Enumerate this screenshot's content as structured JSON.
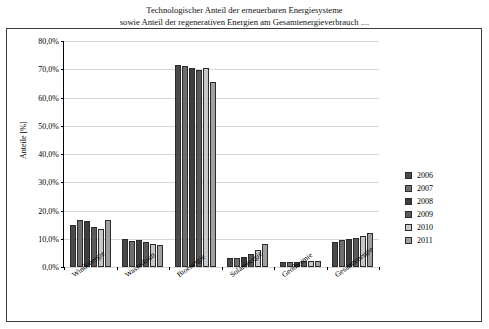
{
  "title": {
    "line1": "Technologischer Anteil der erneuerbaren Energiesysteme",
    "line2": "sowie Anteil der  regenerativen Energien am Gesamtenergieverbrauch ...."
  },
  "chart_data": {
    "type": "bar",
    "title": "Technologischer Anteil der erneuerbaren Energiesysteme sowie Anteil der  regenerativen Energien am Gesamtenergieverbrauch ....",
    "xlabel": "",
    "ylabel": "Anteile [%]",
    "ylim": [
      0,
      80
    ],
    "ytick_labels": [
      "0,0%",
      "10,0%",
      "20,0%",
      "30,0%",
      "40,0%",
      "50,0%",
      "60,0%",
      "70,0%",
      "80,0%"
    ],
    "ytick_values": [
      0,
      10,
      20,
      30,
      40,
      50,
      60,
      70,
      80
    ],
    "grid": true,
    "legend_position": "right",
    "categories": [
      "Windenergie",
      "Wasserkraft",
      "Bioenergie",
      "Solarenergie",
      "Geothermie",
      "Gesamtenergie"
    ],
    "series": [
      {
        "name": "2006",
        "color": "#4a4a4a",
        "values": [
          15.0,
          9.8,
          71.5,
          3.2,
          1.8,
          8.7
        ]
      },
      {
        "name": "2007",
        "color": "#6e6e6e",
        "values": [
          16.6,
          9.3,
          71.0,
          3.2,
          1.8,
          9.5
        ]
      },
      {
        "name": "2008",
        "color": "#3d3d3d",
        "values": [
          16.3,
          9.5,
          70.6,
          3.4,
          1.9,
          9.8
        ]
      },
      {
        "name": "2009",
        "color": "#5a5a5a",
        "values": [
          14.1,
          9.0,
          69.9,
          4.5,
          2.0,
          10.3
        ]
      },
      {
        "name": "2010",
        "color": "#c8c8c8",
        "values": [
          13.6,
          8.2,
          70.4,
          6.0,
          2.0,
          11.0
        ]
      },
      {
        "name": "2011",
        "color": "#a0a0a0",
        "values": [
          16.8,
          7.9,
          65.4,
          8.2,
          2.1,
          12.0
        ]
      }
    ]
  }
}
